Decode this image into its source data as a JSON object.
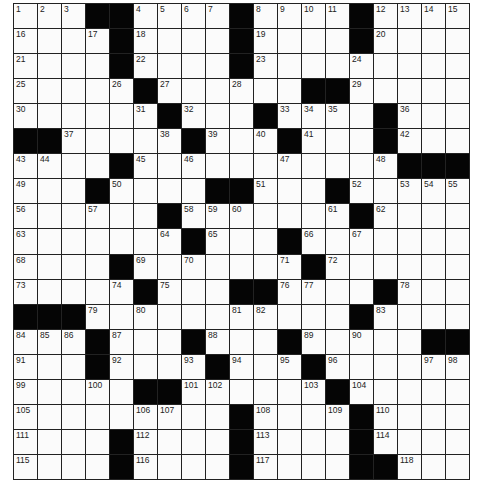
{
  "puzzle": {
    "rows": 19,
    "cols": 19,
    "colors": {
      "black": "#050505",
      "white": "#fbfbfb",
      "line": "#222222"
    },
    "legend": {
      "#": "black square",
      ".": "empty white square",
      "number": "numbered white square"
    },
    "grid": [
      [
        "1",
        "2",
        "3",
        "#",
        "#",
        "4",
        "5",
        "6",
        "7",
        "#",
        "8",
        "9",
        "10",
        "11",
        "#",
        "12",
        "13",
        "14",
        "15"
      ],
      [
        "16",
        ".",
        ".",
        "17",
        "#",
        "18",
        ".",
        ".",
        ".",
        "#",
        "19",
        ".",
        ".",
        ".",
        "#",
        "20",
        ".",
        ".",
        "."
      ],
      [
        "21",
        ".",
        ".",
        ".",
        "#",
        "22",
        ".",
        ".",
        ".",
        "#",
        "23",
        ".",
        ".",
        ".",
        "24",
        ".",
        ".",
        ".",
        "."
      ],
      [
        "25",
        ".",
        ".",
        ".",
        "26",
        "#",
        "27",
        ".",
        ".",
        "28",
        ".",
        ".",
        "#",
        "#",
        "29",
        ".",
        ".",
        ".",
        "."
      ],
      [
        "30",
        ".",
        ".",
        ".",
        ".",
        "31",
        "#",
        "32",
        ".",
        ".",
        "#",
        "33",
        "34",
        "35",
        ".",
        "#",
        "36",
        ".",
        "."
      ],
      [
        "#",
        "#",
        "37",
        ".",
        ".",
        ".",
        "38",
        "#",
        "39",
        ".",
        "40",
        "#",
        "41",
        ".",
        ".",
        "#",
        "42",
        ".",
        "."
      ],
      [
        "43",
        "44",
        ".",
        ".",
        "#",
        "45",
        ".",
        "46",
        ".",
        ".",
        ".",
        "47",
        ".",
        ".",
        ".",
        "48",
        "#",
        "#",
        "#"
      ],
      [
        "49",
        ".",
        ".",
        "#",
        "50",
        ".",
        ".",
        ".",
        "#",
        "#",
        "51",
        ".",
        ".",
        "#",
        "52",
        ".",
        "53",
        "54",
        "55"
      ],
      [
        "56",
        ".",
        ".",
        "57",
        ".",
        ".",
        "#",
        "58",
        "59",
        "60",
        ".",
        ".",
        ".",
        "61",
        "#",
        "62",
        ".",
        ".",
        "."
      ],
      [
        "63",
        ".",
        ".",
        ".",
        ".",
        ".",
        "64",
        "#",
        "65",
        ".",
        ".",
        "#",
        "66",
        ".",
        "67",
        ".",
        ".",
        ".",
        "."
      ],
      [
        "68",
        ".",
        ".",
        ".",
        "#",
        "69",
        ".",
        "70",
        ".",
        ".",
        ".",
        "71",
        "#",
        "72",
        ".",
        ".",
        ".",
        ".",
        "."
      ],
      [
        "73",
        ".",
        ".",
        ".",
        "74",
        "#",
        "75",
        ".",
        ".",
        "#",
        "#",
        "76",
        "77",
        ".",
        ".",
        "#",
        "78",
        ".",
        "."
      ],
      [
        "#",
        "#",
        "#",
        "79",
        ".",
        "80",
        ".",
        ".",
        ".",
        "81",
        "82",
        ".",
        ".",
        ".",
        "#",
        "83",
        ".",
        ".",
        "."
      ],
      [
        "84",
        "85",
        "86",
        "#",
        "87",
        ".",
        ".",
        "#",
        "88",
        ".",
        ".",
        "#",
        "89",
        ".",
        "90",
        ".",
        ".",
        "#",
        "#"
      ],
      [
        "91",
        ".",
        ".",
        "#",
        "92",
        ".",
        ".",
        "93",
        "#",
        "94",
        ".",
        "95",
        "#",
        "96",
        ".",
        ".",
        ".",
        "97",
        "98"
      ],
      [
        "99",
        ".",
        ".",
        "100",
        ".",
        "#",
        "#",
        "101",
        "102",
        ".",
        ".",
        ".",
        "103",
        "#",
        "104",
        ".",
        ".",
        ".",
        "."
      ],
      [
        "105",
        ".",
        ".",
        ".",
        ".",
        "106",
        "107",
        ".",
        ".",
        "#",
        "108",
        ".",
        ".",
        "109",
        "#",
        "110",
        ".",
        ".",
        "."
      ],
      [
        "111",
        ".",
        ".",
        ".",
        "#",
        "112",
        ".",
        ".",
        ".",
        "#",
        "113",
        ".",
        ".",
        ".",
        "#",
        "114",
        ".",
        ".",
        "."
      ],
      [
        "115",
        ".",
        ".",
        ".",
        "#",
        "116",
        ".",
        ".",
        ".",
        "#",
        "117",
        ".",
        ".",
        ".",
        "#",
        "#",
        "118",
        ".",
        "."
      ]
    ]
  }
}
